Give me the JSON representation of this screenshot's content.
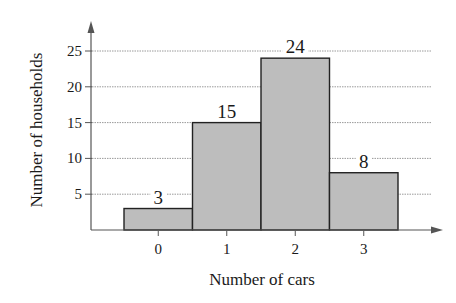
{
  "chart_data": {
    "type": "bar",
    "subtype": "histogram",
    "title": "",
    "xlabel": "Number of cars",
    "ylabel": "Number of households",
    "categories": [
      "0",
      "1",
      "2",
      "3"
    ],
    "values": [
      3,
      15,
      24,
      8
    ],
    "data_labels": [
      "3",
      "15",
      "24",
      "8"
    ],
    "yticks": [
      5,
      10,
      15,
      20,
      25
    ],
    "ytick_labels": [
      "5",
      "10",
      "15",
      "20",
      "25"
    ],
    "ylim": [
      0,
      27
    ],
    "grid": {
      "horizontal": true,
      "style": "dotted"
    },
    "legend": null,
    "colors": {
      "bar_fill": "#bdbdbd",
      "bar_stroke": "#222222",
      "grid": "#9a9a9a",
      "axis": "#555555"
    }
  }
}
